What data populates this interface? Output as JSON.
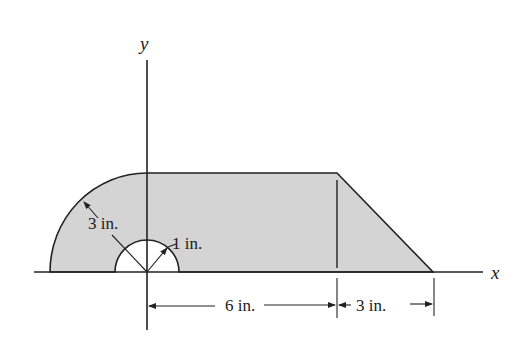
{
  "figure": {
    "type": "engineering-area-diagram",
    "axes": {
      "x_label": "x",
      "y_label": "y"
    },
    "shape": {
      "description": "Quarter-circle of radius 3 in. on the left, rectangle 6 in. wide, right triangle 3 in. wide; semicircular hole of radius 1 in. at origin",
      "fill_color": "#d4d4d4",
      "stroke_color": "#222222"
    },
    "dimensions": {
      "outer_radius": "3 in.",
      "inner_radius": "1 in.",
      "rect_width": "6 in.",
      "triangle_width": "3 in."
    }
  }
}
